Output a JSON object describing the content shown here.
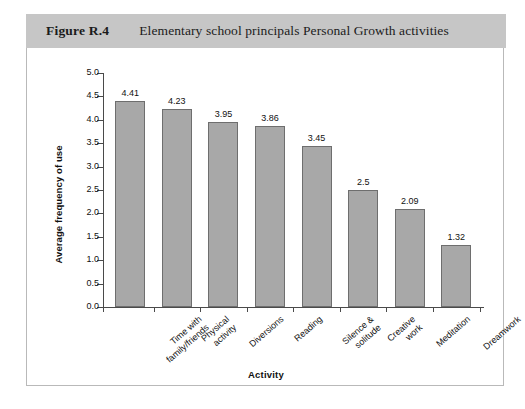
{
  "figure": {
    "number": "Figure R.4",
    "caption": "Elementary school principals Personal Growth activities"
  },
  "chart_data": {
    "type": "bar",
    "title": "Elementary school principals Personal Growth activities",
    "xlabel": "Activity",
    "ylabel": "Average frequency of use",
    "ylim": [
      0.0,
      5.0
    ],
    "ytick_step": 0.5,
    "grid": false,
    "legend": null,
    "categories": [
      "Time with family/friends",
      "Physical activity",
      "Diversions",
      "Reading",
      "Silence & solitude",
      "Creative work",
      "Meditation",
      "Dreamwork"
    ],
    "category_lines": [
      [
        "Time with",
        "family/friends"
      ],
      [
        "Physical",
        "activity"
      ],
      [
        "Diversions"
      ],
      [
        "Reading"
      ],
      [
        "Silence &",
        "solitude"
      ],
      [
        "Creative",
        "work"
      ],
      [
        "Meditation"
      ],
      [
        "Dreamwork"
      ]
    ],
    "values": [
      4.41,
      4.23,
      3.95,
      3.86,
      3.45,
      2.5,
      2.09,
      1.32
    ],
    "value_labels": [
      "4.41",
      "4.23",
      "3.95",
      "3.86",
      "3.45",
      "2.5",
      "2.09",
      "1.32"
    ],
    "ytick_labels": [
      "5.0",
      "4.5",
      "4.0",
      "3.5",
      "3.0",
      "2.5",
      "2.0",
      "1.5",
      "1.0",
      "0.5",
      "0.0"
    ],
    "bar_color": "#a8a8a8",
    "bar_border_color": "#6e6e6e",
    "axis_color": "#4a4a4a"
  },
  "style": {
    "header_background": "#c6c6c6",
    "card_border": "#b9b9b9",
    "page_background": "#ffffff"
  }
}
